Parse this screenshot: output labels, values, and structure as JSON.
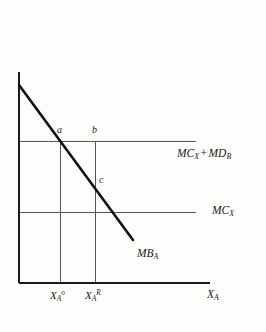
{
  "figure": {
    "background_color": "#fdfdfc",
    "ink_color": "#1a1a1a",
    "thin_line_color": "#555555",
    "type": "economics-line-diagram"
  },
  "axes": {
    "y_axis": {
      "name": "vertical-axis",
      "x": 19,
      "y_top": 72,
      "y_bottom": 283
    },
    "x_axis": {
      "name": "horizontal-axis",
      "y": 283,
      "x_left": 19,
      "x_right": 210
    },
    "x_axis_label": {
      "base": "X",
      "sub": "A"
    }
  },
  "curves": [
    {
      "id": "mb",
      "label": {
        "base": "MB",
        "sub": "A"
      },
      "label_x": 137,
      "label_y": 248,
      "from": {
        "x": 19,
        "y": 85
      },
      "to": {
        "x": 133,
        "y": 240
      },
      "stroke_width": 2.6
    }
  ],
  "horizontal_lines": [
    {
      "id": "mc-plus-md",
      "label": {
        "first": "MC",
        "first_sub": "X",
        "operator": "+",
        "second": "MD",
        "second_sub": "B"
      },
      "y": 141,
      "x_start": 19,
      "x_end": 196,
      "label_x": 177,
      "label_y": 148
    },
    {
      "id": "mc",
      "label": {
        "first": "MC",
        "first_sub": "X"
      },
      "y": 212,
      "x_start": 19,
      "x_end": 196,
      "label_x": 212,
      "label_y": 205
    }
  ],
  "vertical_lines": [
    {
      "id": "x-opt",
      "x": 60,
      "y_top": 141,
      "y_bottom": 283
    },
    {
      "id": "x-reg",
      "x": 95,
      "y_top": 141,
      "y_bottom": 283
    }
  ],
  "points": [
    {
      "id": "a",
      "label": "a",
      "x": 60,
      "y": 141,
      "label_x": 57,
      "label_y": 125
    },
    {
      "id": "b",
      "label": "b",
      "x": 95,
      "y": 141,
      "label_x": 92,
      "label_y": 125
    },
    {
      "id": "c",
      "label": "c",
      "x": 95,
      "y": 182,
      "label_x": 99,
      "label_y": 175
    }
  ],
  "x_ticks": [
    {
      "id": "x-a-optimal",
      "x": 60,
      "base": "X",
      "sub": "A",
      "sup": "o",
      "label_x": 50,
      "label_y": 290
    },
    {
      "id": "x-a-regulated",
      "x": 95,
      "base": "X",
      "sub": "A",
      "sup": "R",
      "label_x": 85,
      "label_y": 290
    }
  ]
}
